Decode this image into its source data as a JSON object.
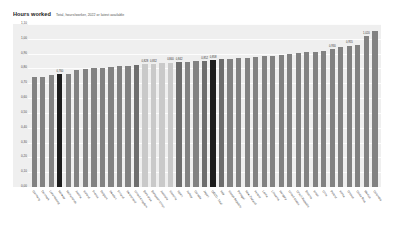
{
  "header": {
    "title": "Hours worked",
    "subtitle": "Total, hours/worker, 2022 or latest available"
  },
  "chart_data": {
    "type": "bar",
    "title": "Hours worked",
    "subtitle": "Total, hours/worker, 2022 or latest available",
    "xlabel": "",
    "ylabel": "",
    "ylim": [
      0.0,
      1.1
    ],
    "grid": true,
    "legend": false,
    "ytick_labels": [
      "0,00",
      "0,10",
      "0,20",
      "0,30",
      "0,40",
      "0,50",
      "0,60",
      "0,70",
      "0,80",
      "0,90",
      "1,00",
      "1,10"
    ],
    "ytick_values": [
      0.0,
      0.1,
      0.2,
      0.3,
      0.4,
      0.5,
      0.6,
      0.7,
      0.8,
      0.9,
      1.0,
      1.1
    ],
    "categories": [
      "Germany",
      "Denmark",
      "Luxembourg",
      "Norway",
      "Netherlands",
      "Austria",
      "Iceland",
      "France",
      "Belgium",
      "Sweden",
      "Finland",
      "Switzerland",
      "United Kingdom",
      "Euro area",
      "European Union",
      "Australia",
      "Slovenia",
      "Spain",
      "Turkey",
      "Canada",
      "Japan",
      "OECD - Total",
      "Italy",
      "Slovak Republic",
      "Portugal",
      "New Zealand",
      "Ireland",
      "Latvia",
      "Lithuania",
      "Hungary",
      "United States",
      "Czech Republic",
      "Estonia",
      "Israel",
      "Chile",
      "Poland",
      "Korea",
      "Greece",
      "Costa Rica",
      "Mexico",
      "Colombia"
    ],
    "values": [
      0.74,
      0.745,
      0.755,
      0.76,
      0.765,
      0.79,
      0.795,
      0.8,
      0.805,
      0.81,
      0.815,
      0.82,
      0.825,
      0.828,
      0.832,
      0.836,
      0.84,
      0.842,
      0.845,
      0.848,
      0.852,
      0.858,
      0.862,
      0.866,
      0.87,
      0.874,
      0.878,
      0.882,
      0.886,
      0.89,
      0.896,
      0.902,
      0.908,
      0.912,
      0.918,
      0.93,
      0.945,
      0.955,
      0.958,
      1.02,
      1.055
    ],
    "highlight_dark_indices": [
      3,
      21
    ],
    "highlight_light_indices": [
      13,
      14,
      15,
      16
    ],
    "highlight_mid_indices": [
      12,
      17,
      20,
      22
    ],
    "labeled_indices": [
      3,
      13,
      14,
      16,
      17,
      20,
      21,
      35,
      37,
      39
    ],
    "label_texts": {
      "3": "0,760",
      "13": "0,828",
      "14": "0,832",
      "16": "0,840",
      "17": "0,842",
      "20": "0,852",
      "21": "0,858",
      "35": "0,930",
      "37": "0,955",
      "39": "1,020"
    },
    "colors": {
      "bar": "#828282",
      "bar_highlight": "#1c1c1c",
      "bar_light": "#c9c9c9",
      "bar_mid": "#6e6e6e",
      "plot_background": "#efefef",
      "gridline": "#ffffff",
      "page_background": "#ffffff"
    }
  }
}
